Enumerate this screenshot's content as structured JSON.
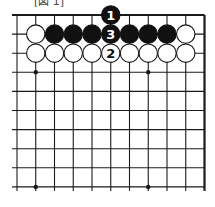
{
  "diagram": {
    "caption": "[図 1]",
    "board": {
      "columns": 11,
      "rows": 10,
      "origin_x": 17,
      "origin_y": 15,
      "spacing_x": 18.75,
      "spacing_y": 19.1,
      "top_edge": true,
      "right_edge": true,
      "left_extend": 5,
      "bottom_extend": 4,
      "line_color": "#1a1a1a",
      "stone_radius": 9.2
    },
    "star_points": [
      {
        "col": 1,
        "row": 3
      },
      {
        "col": 7,
        "row": 3
      },
      {
        "col": 1,
        "row": 9
      },
      {
        "col": 7,
        "row": 9
      }
    ],
    "stones": [
      {
        "col": 5,
        "row": 0,
        "color": "black",
        "label": "1"
      },
      {
        "col": 1,
        "row": 1,
        "color": "white",
        "label": ""
      },
      {
        "col": 2,
        "row": 1,
        "color": "black",
        "label": ""
      },
      {
        "col": 3,
        "row": 1,
        "color": "black",
        "label": ""
      },
      {
        "col": 4,
        "row": 1,
        "color": "black",
        "label": ""
      },
      {
        "col": 5,
        "row": 1,
        "color": "black",
        "label": "3"
      },
      {
        "col": 6,
        "row": 1,
        "color": "black",
        "label": ""
      },
      {
        "col": 7,
        "row": 1,
        "color": "black",
        "label": ""
      },
      {
        "col": 8,
        "row": 1,
        "color": "black",
        "label": ""
      },
      {
        "col": 9,
        "row": 1,
        "color": "white",
        "label": ""
      },
      {
        "col": 1,
        "row": 2,
        "color": "white",
        "label": ""
      },
      {
        "col": 2,
        "row": 2,
        "color": "white",
        "label": ""
      },
      {
        "col": 3,
        "row": 2,
        "color": "white",
        "label": ""
      },
      {
        "col": 4,
        "row": 2,
        "color": "white",
        "label": ""
      },
      {
        "col": 5,
        "row": 2,
        "color": "white",
        "label": "2"
      },
      {
        "col": 6,
        "row": 2,
        "color": "white",
        "label": ""
      },
      {
        "col": 7,
        "row": 2,
        "color": "white",
        "label": ""
      },
      {
        "col": 8,
        "row": 2,
        "color": "white",
        "label": ""
      },
      {
        "col": 9,
        "row": 2,
        "color": "white",
        "label": ""
      }
    ],
    "colors": {
      "black_stone": "#111111",
      "white_stone": "#ffffff",
      "stone_outline": "#111111",
      "black_label": "#ffffff",
      "white_label": "#111111"
    }
  }
}
